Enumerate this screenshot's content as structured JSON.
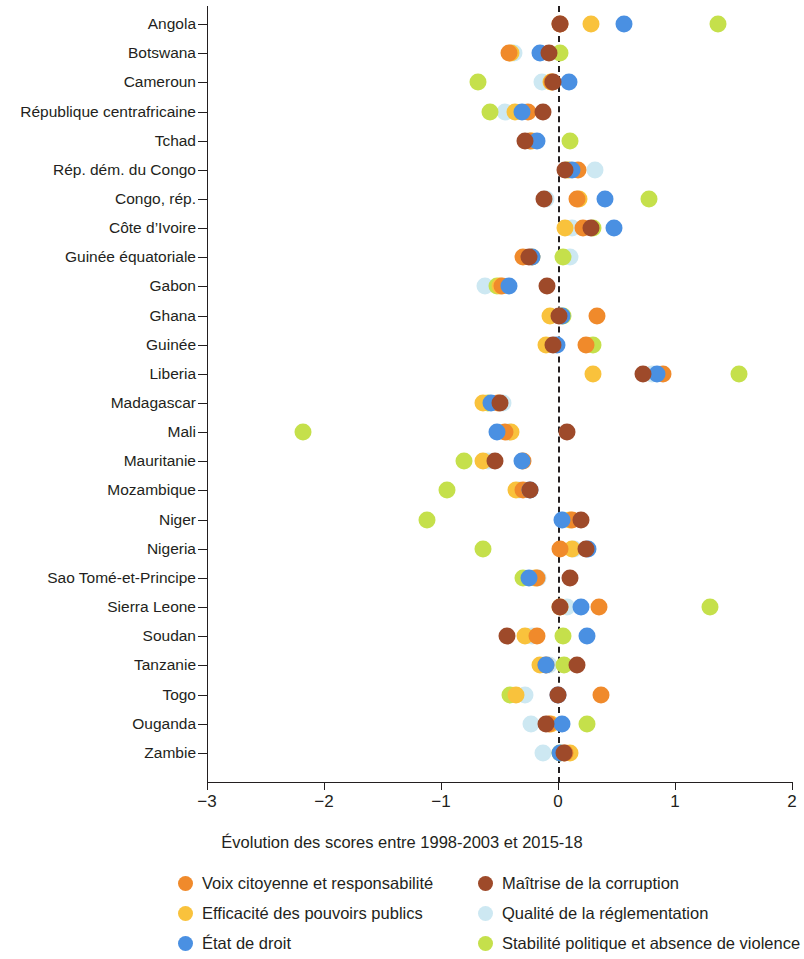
{
  "chart_data": {
    "type": "scatter",
    "title": "",
    "xlabel": "Évolution des scores entre 1998-2003 et 2015-18",
    "ylabel": "",
    "xlim": [
      -3,
      2
    ],
    "xticks": [
      -3,
      -2,
      -1,
      0,
      1,
      2
    ],
    "xtick_labels": [
      "−3",
      "−2",
      "−1",
      "0",
      "1",
      "2"
    ],
    "grid": false,
    "reference_line": 0,
    "legend_position": "bottom",
    "series_colors": {
      "voix": "#F08A2B",
      "efficacite": "#F9C23C",
      "etat_de_droit": "#4A90E2",
      "corruption": "#9E4A2A",
      "reglementation": "#CDE8F2",
      "stabilite": "#C5E04B"
    },
    "series": [
      {
        "key": "voix",
        "name": "Voix citoyenne et responsabilité",
        "color": "#F08A2B"
      },
      {
        "key": "efficacite",
        "name": "Efficacité des pouvoirs publics",
        "color": "#F9C23C"
      },
      {
        "key": "etat_de_droit",
        "name": "État de droit",
        "color": "#4A90E2"
      },
      {
        "key": "corruption",
        "name": "Maîtrise de la corruption",
        "color": "#9E4A2A"
      },
      {
        "key": "reglementation",
        "name": "Qualité de la réglementation",
        "color": "#CDE8F2"
      },
      {
        "key": "stabilite",
        "name": "Stabilité politique et absence de violence",
        "color": "#C5E04B"
      }
    ],
    "categories": [
      "Angola",
      "Botswana",
      "Cameroun",
      "République centrafricaine",
      "Tchad",
      "Rép. dém. du Congo",
      "Congo, rép.",
      "Côte d’Ivoire",
      "Guinée équatoriale",
      "Gabon",
      "Ghana",
      "Guinée",
      "Liberia",
      "Madagascar",
      "Mali",
      "Mauritanie",
      "Mozambique",
      "Niger",
      "Nigeria",
      "Sao Tomé-et-Principe",
      "Sierra Leone",
      "Soudan",
      "Tanzanie",
      "Togo",
      "Ouganda",
      "Zambie"
    ],
    "points": {
      "Angola": {
        "voix": 0.02,
        "efficacite": 0.28,
        "etat_de_droit": 0.56,
        "corruption": 0.02,
        "reglementation": 0.02,
        "stabilite": 1.37
      },
      "Botswana": {
        "voix": -0.42,
        "efficacite": -0.4,
        "etat_de_droit": -0.15,
        "corruption": -0.08,
        "reglementation": -0.38,
        "stabilite": 0.02
      },
      "Cameroun": {
        "voix": -0.05,
        "efficacite": -0.06,
        "etat_de_droit": 0.09,
        "corruption": -0.04,
        "reglementation": -0.14,
        "stabilite": -0.68
      },
      "République centrafricaine": {
        "voix": -0.26,
        "efficacite": -0.37,
        "etat_de_droit": -0.31,
        "corruption": -0.13,
        "reglementation": -0.45,
        "stabilite": -0.58
      },
      "Tchad": {
        "voix": -0.24,
        "efficacite": -0.22,
        "etat_de_droit": -0.18,
        "corruption": -0.28,
        "reglementation": -0.24,
        "stabilite": 0.1
      },
      "Rép. dém. du Congo": {
        "voix": 0.17,
        "efficacite": 0.09,
        "etat_de_droit": 0.12,
        "corruption": 0.06,
        "reglementation": 0.32,
        "stabilite": 0.08
      },
      "Congo, rép.": {
        "voix": 0.16,
        "efficacite": 0.18,
        "etat_de_droit": 0.4,
        "corruption": -0.12,
        "reglementation": -0.1,
        "stabilite": 0.78
      },
      "Côte d’Ivoire": {
        "voix": 0.21,
        "efficacite": 0.06,
        "etat_de_droit": 0.48,
        "corruption": 0.28,
        "reglementation": 0.12,
        "stabilite": 0.3
      },
      "Guinée équatoriale": {
        "voix": -0.3,
        "efficacite": -0.22,
        "etat_de_droit": -0.22,
        "corruption": -0.25,
        "reglementation": 0.1,
        "stabilite": 0.04
      },
      "Gabon": {
        "voix": -0.48,
        "efficacite": -0.5,
        "etat_de_droit": -0.42,
        "corruption": -0.09,
        "reglementation": -0.62,
        "stabilite": -0.52
      },
      "Ghana": {
        "voix": 0.33,
        "efficacite": -0.07,
        "etat_de_droit": 0.03,
        "corruption": 0.01,
        "reglementation": 0.02,
        "stabilite": 0.04
      },
      "Guinée": {
        "voix": 0.24,
        "efficacite": -0.1,
        "etat_de_droit": -0.01,
        "corruption": -0.04,
        "reglementation": -0.03,
        "stabilite": 0.3
      },
      "Liberia": {
        "voix": 0.9,
        "efficacite": 0.3,
        "etat_de_droit": 0.85,
        "corruption": 0.73,
        "reglementation": 0.8,
        "stabilite": 1.55
      },
      "Madagascar": {
        "voix": -0.51,
        "efficacite": -0.64,
        "etat_de_droit": -0.57,
        "corruption": -0.5,
        "reglementation": -0.47,
        "stabilite": -0.6
      },
      "Mali": {
        "voix": -0.45,
        "efficacite": -0.4,
        "etat_de_droit": -0.52,
        "corruption": 0.08,
        "reglementation": -0.42,
        "stabilite": -2.18
      },
      "Mauritanie": {
        "voix": -0.3,
        "efficacite": -0.64,
        "etat_de_droit": -0.31,
        "corruption": -0.54,
        "reglementation": -0.6,
        "stabilite": -0.8
      },
      "Mozambique": {
        "voix": -0.3,
        "efficacite": -0.36,
        "etat_de_droit": -0.24,
        "corruption": -0.24,
        "reglementation": -0.33,
        "stabilite": -0.95
      },
      "Niger": {
        "voix": 0.12,
        "efficacite": 0.1,
        "etat_de_droit": 0.03,
        "corruption": 0.2,
        "reglementation": 0.04,
        "stabilite": -1.12
      },
      "Nigeria": {
        "voix": 0.02,
        "efficacite": 0.12,
        "etat_de_droit": 0.26,
        "corruption": 0.24,
        "reglementation": 0.14,
        "stabilite": -0.64
      },
      "Sao Tomé-et-Principe": {
        "voix": -0.18,
        "efficacite": -0.2,
        "etat_de_droit": -0.25,
        "corruption": 0.1,
        "reglementation": -0.17,
        "stabilite": -0.3
      },
      "Sierra Leone": {
        "voix": 0.35,
        "efficacite": 0.02,
        "etat_de_droit": 0.2,
        "corruption": 0.02,
        "reglementation": 0.08,
        "stabilite": 1.3
      },
      "Soudan": {
        "voix": -0.18,
        "efficacite": -0.28,
        "etat_de_droit": 0.25,
        "corruption": -0.44,
        "reglementation": -0.22,
        "stabilite": 0.04
      },
      "Tanzanie": {
        "voix": -0.1,
        "efficacite": -0.15,
        "etat_de_droit": -0.1,
        "corruption": 0.16,
        "reglementation": -0.08,
        "stabilite": 0.05
      },
      "Togo": {
        "voix": 0.37,
        "efficacite": -0.36,
        "etat_de_droit": 0.0,
        "corruption": 0.0,
        "reglementation": -0.28,
        "stabilite": -0.41
      },
      "Ouganda": {
        "voix": -0.08,
        "efficacite": -0.06,
        "etat_de_droit": 0.03,
        "corruption": -0.1,
        "reglementation": -0.23,
        "stabilite": 0.25
      },
      "Zambie": {
        "voix": 0.06,
        "efficacite": 0.1,
        "etat_de_droit": 0.02,
        "corruption": 0.05,
        "reglementation": -0.13,
        "stabilite": 0.02
      }
    }
  },
  "legend": {
    "left": [
      "Voix citoyenne et responsabilité",
      "Efficacité des pouvoirs publics",
      "État de droit"
    ],
    "right": [
      "Maîtrise de la corruption",
      "Qualité de la réglementation",
      "Stabilité politique et absence de violence"
    ]
  }
}
